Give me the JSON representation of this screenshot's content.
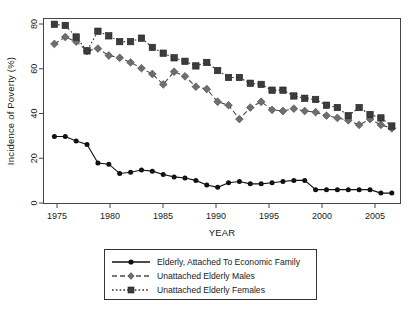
{
  "chart_data": {
    "type": "line",
    "title": "",
    "xlabel": "YEAR",
    "ylabel": "Incidence of Poverty (%)",
    "xlim": [
      1975.0,
      2007.8
    ],
    "ylim": [
      0,
      80
    ],
    "xticks": [
      1975,
      1980,
      1985,
      1990,
      1995,
      2000,
      2005
    ],
    "yticks": [
      0,
      20,
      40,
      60,
      80
    ],
    "grid": false,
    "legend_position": "below-axes",
    "x": [
      1976,
      1977,
      1978,
      1979,
      1980,
      1981,
      1982,
      1983,
      1984,
      1985,
      1986,
      1987,
      1988,
      1989,
      1990,
      1991,
      1992,
      1993,
      1994,
      1995,
      1996,
      1997,
      1998,
      1999,
      2000,
      2001,
      2002,
      2003,
      2004,
      2005,
      2006,
      2007
    ],
    "series": [
      {
        "name": "Elderly, Attached To Economic Family",
        "marker": "circle",
        "linestyle": "solid",
        "color": "#111111",
        "values": [
          29.0,
          29.0,
          27.0,
          25.5,
          17.5,
          17.0,
          13.0,
          13.5,
          14.5,
          14.0,
          12.5,
          11.5,
          11.0,
          10.0,
          8.0,
          7.0,
          9.0,
          9.5,
          8.5,
          8.5,
          9.0,
          9.5,
          10.0,
          10.0,
          6.0,
          6.0,
          6.0,
          6.0,
          6.0,
          6.0,
          4.5,
          4.5
        ]
      },
      {
        "name": "Unattached Elderly Males",
        "marker": "diamond",
        "linestyle": "dashed",
        "color": "#6e6e6e",
        "values": [
          69.0,
          72.0,
          70.0,
          66.0,
          67.0,
          64.0,
          63.0,
          61.0,
          58.5,
          56.0,
          51.5,
          57.0,
          55.0,
          50.5,
          49.5,
          44.0,
          42.5,
          36.5,
          41.5,
          44.0,
          40.5,
          40.0,
          41.0,
          40.0,
          39.5,
          38.0,
          37.0,
          36.0,
          34.0,
          36.5,
          34.0,
          32.5
        ]
      },
      {
        "name": "Unattached Elderly Females",
        "marker": "square",
        "linestyle": "dotted",
        "color": "#3c3c3c",
        "values": [
          77.5,
          77.0,
          72.0,
          66.0,
          74.5,
          72.5,
          70.0,
          70.0,
          71.5,
          67.5,
          65.0,
          63.0,
          61.5,
          59.5,
          61.0,
          57.5,
          54.5,
          54.5,
          52.0,
          51.5,
          49.0,
          49.0,
          46.5,
          45.5,
          45.0,
          42.5,
          41.5,
          38.0,
          41.5,
          38.5,
          37.0,
          33.5
        ]
      }
    ]
  },
  "legend": {
    "entries": [
      {
        "label": "Elderly, Attached To Economic Family"
      },
      {
        "label": "Unattached Elderly Males"
      },
      {
        "label": "Unattached Elderly Females"
      }
    ]
  },
  "axes": {
    "y_title": "Incidence of Poverty (%)",
    "x_title": "YEAR",
    "x_tick_labels": [
      "1975",
      "1980",
      "1985",
      "1990",
      "1995",
      "2000",
      "2005"
    ],
    "y_tick_labels": [
      "0",
      "20",
      "40",
      "60",
      "80"
    ]
  },
  "colors": {
    "series_1": "#111111",
    "series_2": "#6e6e6e",
    "series_3": "#3c3c3c",
    "frame": "#444444",
    "background": "#ffffff"
  }
}
